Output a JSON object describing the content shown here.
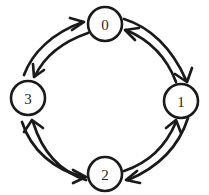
{
  "diagram": {
    "type": "cycle-graph",
    "title": "",
    "background_color": "#ffffff",
    "stroke_color": "#1a1a1a",
    "label_color": "#262626",
    "style": "hand-drawn",
    "nodes": [
      {
        "id": "0",
        "label": "0",
        "position": "top",
        "cx": 105,
        "cy": 24,
        "r": 17
      },
      {
        "id": "1",
        "label": "1",
        "position": "right",
        "cx": 181,
        "cy": 101,
        "r": 17
      },
      {
        "id": "2",
        "label": "2",
        "position": "bottom",
        "cx": 105,
        "cy": 174,
        "r": 17
      },
      {
        "id": "3",
        "label": "3",
        "position": "left",
        "cx": 28,
        "cy": 98,
        "r": 17
      }
    ],
    "edges": [
      {
        "from": "3",
        "to": "0",
        "direction": "bidirectional",
        "shape": "curved"
      },
      {
        "from": "0",
        "to": "1",
        "direction": "bidirectional",
        "shape": "curved"
      },
      {
        "from": "1",
        "to": "2",
        "direction": "bidirectional",
        "shape": "curved"
      },
      {
        "from": "2",
        "to": "3",
        "direction": "bidirectional",
        "shape": "curved"
      }
    ],
    "arrowheads": [
      {
        "name": "arrowhead-3-to-0",
        "edge": "3->0",
        "points_at": "0"
      },
      {
        "name": "arrowhead-0-to-3",
        "edge": "0->3",
        "points_at": "3"
      },
      {
        "name": "arrowhead-1-to-0",
        "edge": "1->0",
        "points_at": "0"
      },
      {
        "name": "arrowhead-0-to-1",
        "edge": "0->1",
        "points_at": "1"
      },
      {
        "name": "arrowhead-2-to-1",
        "edge": "2->1",
        "points_at": "1"
      },
      {
        "name": "arrowhead-1-to-2",
        "edge": "1->2",
        "points_at": "2"
      },
      {
        "name": "arrowhead-3-to-2",
        "edge": "3->2",
        "points_at": "2"
      },
      {
        "name": "arrowhead-2-to-3",
        "edge": "2->3",
        "points_at": "3"
      }
    ]
  }
}
